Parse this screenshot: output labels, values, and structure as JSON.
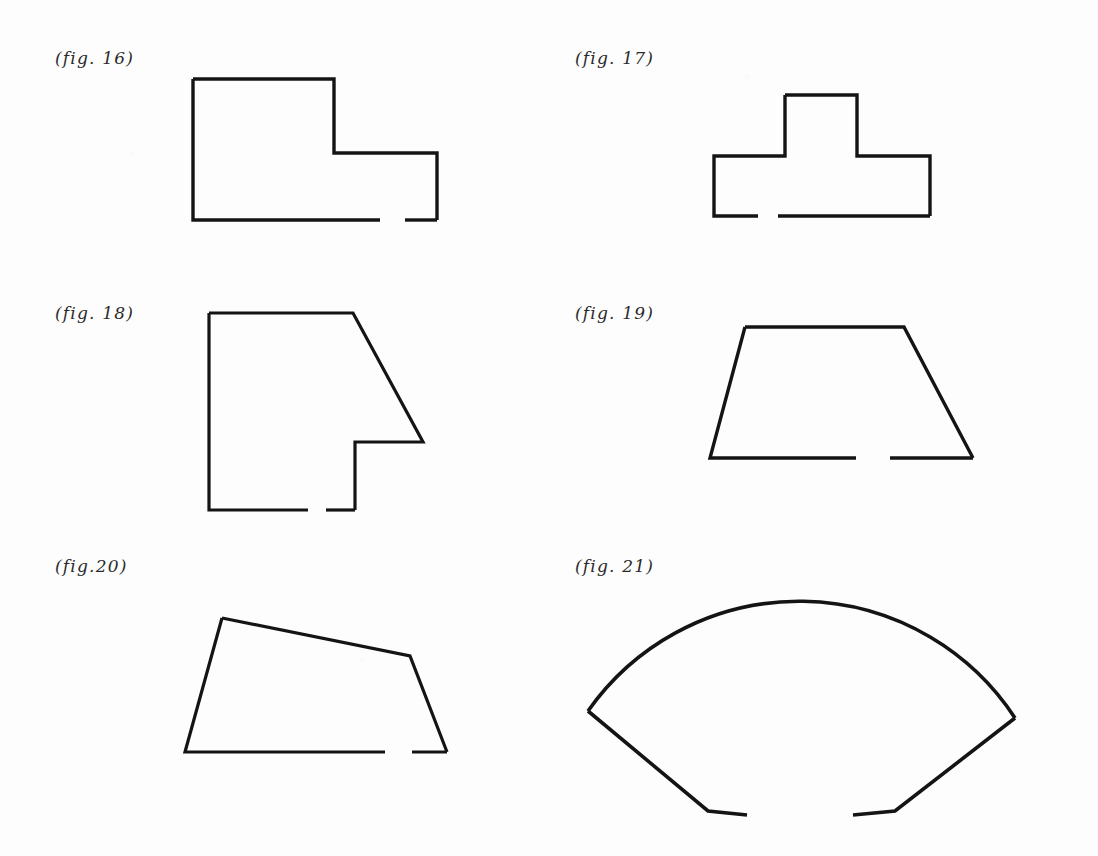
{
  "page": {
    "background_color": "#fdfdfd",
    "ink_color": "#141414",
    "width": 1098,
    "height": 856,
    "kind": "scanned-geometry-figures-page"
  },
  "figures": [
    {
      "id": "fig-16",
      "label": "(fig. 16)",
      "label_x": 55,
      "label_y": 48,
      "shape_type": "L-shaped-polygon",
      "description": "Rectilinear L-shaped outline, tall block on the left, lower step on the right, open gap in the bottom edge",
      "stroke_width": 3.4,
      "viewbox": "0 0 300 180",
      "origin_x": 180,
      "origin_y": 65,
      "paths": [
        "M 13 14 L 154 14 L 154 88 L 257 88 L 257 155",
        "M 13 14 L 13 155 L 200 155",
        "M 225 155 L 257 155"
      ]
    },
    {
      "id": "fig-17",
      "label": "(fig. 17)",
      "label_x": 575,
      "label_y": 48,
      "shape_type": "T-shaped-polygon",
      "description": "Rectilinear T-shaped outline with raised central tab and wide base, open gap in the bottom edge",
      "stroke_width": 3.4,
      "viewbox": "0 0 300 180",
      "origin_x": 690,
      "origin_y": 60,
      "paths": [
        "M 95 35 L 167 35 L 167 96 L 240 96 L 240 156",
        "M 95 35 L 95 96 L 24 96 L 24 156 L 68 156",
        "M 88 156 L 240 156"
      ]
    },
    {
      "id": "fig-18",
      "label": "(fig. 18)",
      "label_x": 55,
      "label_y": 303,
      "shape_type": "notched-polygon-slanted-edge",
      "description": "Quadrilateral with vertical left edge, long slanted right edge, and a rectangular notch cut into the lower right, open gap in the bottom edge",
      "stroke_width": 3.2,
      "viewbox": "0 0 300 230",
      "origin_x": 195,
      "origin_y": 305,
      "paths": [
        "M 14 8 L 158 8 L 228 137 L 160 137 L 160 205",
        "M 14 8 L 14 205 L 113 205",
        "M 131 205 L 160 205"
      ]
    },
    {
      "id": "fig-19",
      "label": "(fig. 19)",
      "label_x": 575,
      "label_y": 303,
      "shape_type": "trapezoid",
      "description": "Isosceles trapezoid with narrow top and wide base, open gap in the bottom edge",
      "stroke_width": 3.4,
      "viewbox": "0 0 320 180",
      "origin_x": 690,
      "origin_y": 310,
      "paths": [
        "M 55 17 L 214 17 L 283 148",
        "M 55 17 L 20 148 L 166 148",
        "M 200 148 L 283 148"
      ]
    },
    {
      "id": "fig-20",
      "label": "(fig.20)",
      "label_x": 55,
      "label_y": 556,
      "shape_type": "irregular-pentagon",
      "description": "Irregular quadrilateral-like pentagon with a slanted top edge descending to the right and a short angled vertex on the right side, open gap in the bottom edge",
      "stroke_width": 3.2,
      "viewbox": "0 0 320 190",
      "origin_x": 170,
      "origin_y": 585,
      "paths": [
        "M 52 33 L 240 71 L 277 167",
        "M 52 33 L 15 167 L 215 167",
        "M 242 167 L 277 167"
      ]
    },
    {
      "id": "fig-21",
      "label": "(fig. 21)",
      "label_x": 575,
      "label_y": 556,
      "shape_type": "circular-sector-fan",
      "description": "Wide circular sector (fan / annular wedge) with a large curved arc on top and two straight radii converging toward a gapped flat bottom",
      "stroke_width": 3.6,
      "viewbox": "0 0 470 270",
      "origin_x": 565,
      "origin_y": 565,
      "paths": [
        "M 23 146 A 258 258 0 0 1 450 153",
        "M 23 146 L 143 246 L 182 250",
        "M 450 153 L 330 246 L 288 250"
      ]
    }
  ]
}
